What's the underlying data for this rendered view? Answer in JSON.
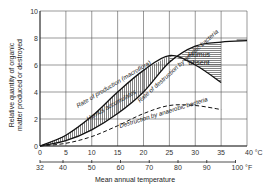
{
  "chart_data": {
    "type": "line",
    "title": "",
    "xlabel": "Mean annual temperature",
    "ylabel": "Relative quantity of organic matter produced or destroyed",
    "ylabel_lines": [
      "Relative quantity of organic",
      "matter produced or destroyed"
    ],
    "x_unit_primary": "°C",
    "x_unit_secondary": "°F",
    "xlim": [
      0,
      40
    ],
    "ylim": [
      0,
      10
    ],
    "grid": true,
    "x_ticks_c": [
      0,
      5,
      10,
      15,
      20,
      25,
      30,
      35,
      40
    ],
    "x_tick_labels_c": [
      "0",
      "5",
      "10",
      "15",
      "20",
      "25",
      "30",
      "35",
      "40 °C"
    ],
    "x_ticks_f": [
      32,
      40,
      50,
      60,
      70,
      80,
      90,
      100
    ],
    "x_tick_labels_f": [
      "32",
      "40",
      "50",
      "60",
      "70",
      "80",
      "90",
      "100 °F"
    ],
    "y_ticks": [
      0,
      2,
      4,
      6,
      8,
      10
    ],
    "y_tick_labels": [
      "0",
      "2",
      "4",
      "6",
      "8",
      "10"
    ],
    "series": [
      {
        "name": "Rate of production (macroflora)",
        "style": "solid",
        "x": [
          0,
          5,
          10,
          15,
          20,
          25,
          30,
          35
        ],
        "y": [
          0,
          0.8,
          2.2,
          4.0,
          5.6,
          6.7,
          6.0,
          4.7
        ]
      },
      {
        "name": "Rate of destruction by aerobic bacteria",
        "style": "solid",
        "x": [
          0,
          5,
          10,
          15,
          20,
          25,
          30,
          35,
          40
        ],
        "y": [
          0,
          0.4,
          1.2,
          2.4,
          4.0,
          6.2,
          7.4,
          7.7,
          7.8
        ]
      },
      {
        "name": "Destruction by anaerobic bacteria",
        "style": "dashed",
        "x": [
          0,
          5,
          10,
          15,
          20,
          25,
          30,
          35
        ],
        "y": [
          0,
          0.2,
          0.7,
          1.5,
          2.4,
          3.0,
          3.0,
          2.7
        ]
      }
    ],
    "annotations": [
      {
        "text": "Humus accumulates",
        "region": "between production and aerobic destruction, 0–25 °C (vertical hatching)"
      },
      {
        "text": "Humus absent",
        "region": "between aerobic destruction and production, 25–35 °C (horizontal hatching)"
      }
    ]
  },
  "labels": {
    "production": "Rate of production (macroflora)",
    "accumulates": "Humus accumulates",
    "aerobic": "Rate of destruction by aerobic bacteria",
    "anaerobic": "Destruction by anaerobic bacteria",
    "humus_absent_1": "Humus",
    "humus_absent_2": "absent",
    "xlabel": "Mean annual temperature",
    "ylabel_1": "Relative quantity of organic",
    "ylabel_2": "matter produced or destroyed"
  }
}
